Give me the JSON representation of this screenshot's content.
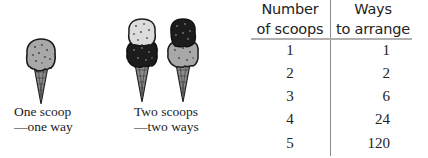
{
  "illustrations": [
    {
      "id": "one-scoop",
      "caption_line1": "One scoop",
      "caption_line2": "—one way",
      "scoops": [
        "light"
      ]
    },
    {
      "id": "two-scoops",
      "caption_line1": "Two scoops",
      "caption_line2": "—two ways",
      "cones": [
        {
          "top": "light",
          "bottom": "dark"
        },
        {
          "top": "dark",
          "bottom": "light"
        }
      ]
    }
  ],
  "table": {
    "headers": [
      {
        "line1": "Number",
        "line2": "of scoops"
      },
      {
        "line1": "Ways",
        "line2": "to arrange"
      }
    ],
    "rows": [
      {
        "scoops": "1",
        "ways": "1"
      },
      {
        "scoops": "2",
        "ways": "2"
      },
      {
        "scoops": "3",
        "ways": "6"
      },
      {
        "scoops": "4",
        "ways": "24"
      },
      {
        "scoops": "5",
        "ways": "120"
      }
    ]
  },
  "colors": {
    "light_scoop": "#a8a8a8",
    "dark_scoop": "#1c1c1c",
    "cone": "#8c8c8c",
    "divider": "#8a8a8a"
  }
}
